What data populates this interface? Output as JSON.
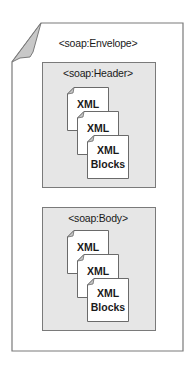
{
  "diagram": {
    "envelope": {
      "label": "<soap:Envelope>"
    },
    "sections": [
      {
        "id": "header",
        "label": "<soap:Header>",
        "documents": [
          {
            "lines": [
              "XML"
            ]
          },
          {
            "lines": [
              "XML"
            ]
          },
          {
            "lines": [
              "XML",
              "Blocks"
            ]
          }
        ]
      },
      {
        "id": "body",
        "label": "<soap:Body>",
        "documents": [
          {
            "lines": [
              "XML"
            ]
          },
          {
            "lines": [
              "XML"
            ]
          },
          {
            "lines": [
              "XML",
              "Blocks"
            ]
          }
        ]
      }
    ],
    "colors": {
      "section_fill": "#e6e6e6",
      "border": "#7a7a7a",
      "fold": "#c8c8c8",
      "page": "#ffffff"
    }
  }
}
